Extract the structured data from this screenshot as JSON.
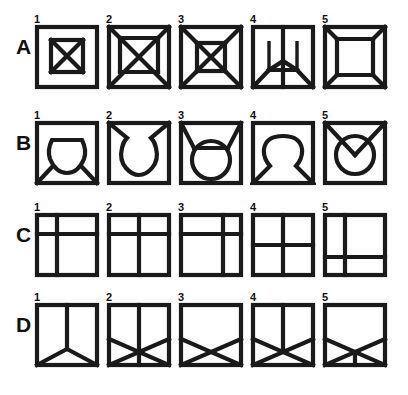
{
  "page": {
    "background_color": "#ffffff",
    "stroke_color": "#1a1a1a",
    "width": 408,
    "height": 395
  },
  "grid": {
    "row_labels": [
      "A",
      "B",
      "C",
      "D"
    ],
    "column_numbers": [
      "1",
      "2",
      "3",
      "4",
      "5"
    ],
    "rows": [
      {
        "label": "A",
        "top": 14,
        "cells": [
          {
            "number": "1",
            "name": "square-with-inner-square-and-x",
            "description": "Outer square containing a smaller centered square with an X through it"
          },
          {
            "number": "2",
            "name": "square-with-inner-square-and-full-diagonals",
            "description": "Outer square with corner diagonals meeting an inscribed square crossed by an X"
          },
          {
            "number": "3",
            "name": "square-with-inner-square-corner-diagonals-and-x",
            "description": "Outer square with corner diagonals to inner square, inner square crossed by an X"
          },
          {
            "number": "4",
            "name": "square-with-vertical-split-and-lower-y-struts",
            "description": "Square split by a vertical center line, with two short inner verticals and diagonal struts to the bottom corners"
          },
          {
            "number": "5",
            "name": "square-with-inner-bevelled-square",
            "description": "Outer square with an inner bevelled square joined to all four corners by short diagonals"
          }
        ]
      },
      {
        "label": "B",
        "top": 110,
        "cells": [
          {
            "number": "1",
            "name": "square-with-flat-top-circle-and-bottom-diagonals",
            "description": "Square containing a circle with a flattened top, diagonals from the bottom corners to the circle"
          },
          {
            "number": "2",
            "name": "square-with-notched-circle-and-top-diagonals",
            "description": "Square containing a circle open at the top, diagonals from the top corners into the notch"
          },
          {
            "number": "3",
            "name": "square-with-circle-and-top-corner-diagonals",
            "description": "Square containing a circle touching the bottom edge with diagonals from the top corners to the circle sides"
          },
          {
            "number": "4",
            "name": "square-with-circle-and-bottom-corner-diagonals",
            "description": "Square containing a circle with tails running down to the bottom corners"
          },
          {
            "number": "5",
            "name": "square-with-circle-and-v-chevron",
            "description": "Square containing a centered circle with a V chevron from the top corners meeting inside the circle"
          }
        ]
      },
      {
        "label": "C",
        "top": 202,
        "cells": [
          {
            "number": "1",
            "name": "square-divided-left-vertical-high-horizontal",
            "description": "Square divided by a vertical line near the left and a horizontal line near the top"
          },
          {
            "number": "2",
            "name": "square-divided-center-vertical-high-horizontal",
            "description": "Square divided by a centered vertical line and a horizontal line near the top"
          },
          {
            "number": "3",
            "name": "square-divided-right-vertical-high-horizontal",
            "description": "Square divided by a vertical line near the right and a horizontal line near the top"
          },
          {
            "number": "4",
            "name": "square-divided-center-vertical-center-horizontal",
            "description": "Square divided into four quadrants by centered vertical and horizontal lines"
          },
          {
            "number": "5",
            "name": "square-divided-left-vertical-low-horizontal",
            "description": "Square divided by a vertical line near the left and a horizontal line near the bottom"
          }
        ]
      },
      {
        "label": "D",
        "top": 292,
        "cells": [
          {
            "number": "1",
            "name": "square-with-inverted-y",
            "description": "Square with a vertical line from the top edge meeting two diagonals to the bottom corners"
          },
          {
            "number": "2",
            "name": "square-with-vertical-and-lower-x",
            "description": "Square with a full vertical centre line and an X spanning the lower half"
          },
          {
            "number": "3",
            "name": "square-with-lower-x",
            "description": "Square with an X spanning the lower half only"
          },
          {
            "number": "4",
            "name": "square-with-upper-vertical-and-lower-x",
            "description": "Square with a vertical line from the top edge to the centre and an X across the lower half"
          },
          {
            "number": "5",
            "name": "square-with-lower-x-and-short-vertical",
            "description": "Square with an X across the lower half and a short vertical from the crossing point down to the bottom edge"
          }
        ]
      }
    ],
    "cell_x_positions": [
      32,
      104,
      176,
      248,
      320
    ]
  }
}
